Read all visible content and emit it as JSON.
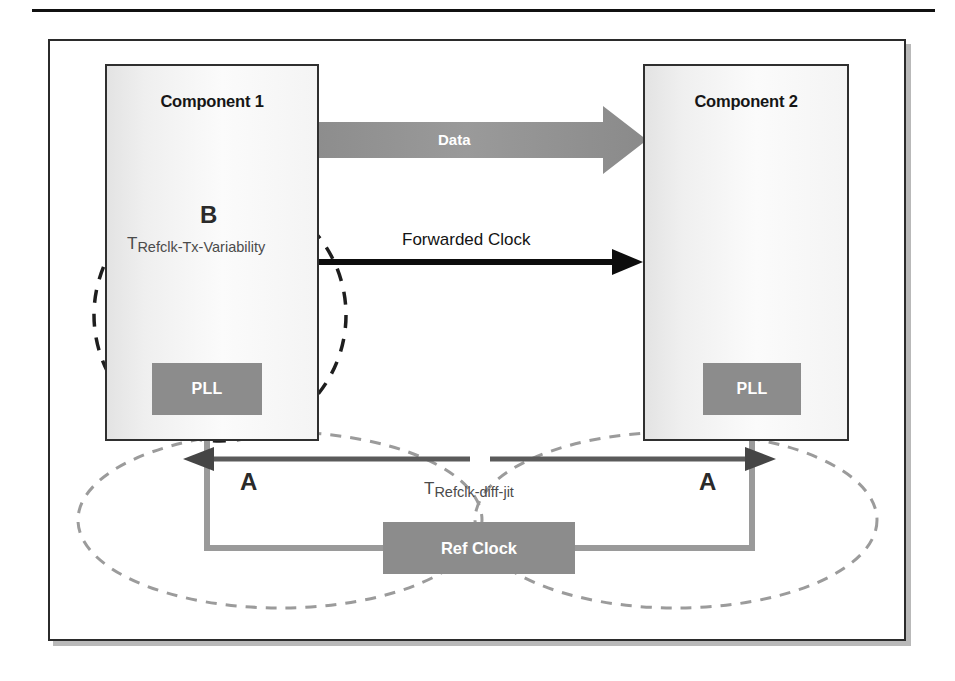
{
  "figure": {
    "components": [
      {
        "id": "component-1",
        "title": "Component 1",
        "pll_label": "PLL"
      },
      {
        "id": "component-2",
        "title": "Component 2",
        "pll_label": "PLL"
      }
    ],
    "ref_clock": {
      "label": "Ref Clock"
    },
    "signals": {
      "data_arrow_label": "Data",
      "forwarded_clock_label": "Forwarded Clock"
    },
    "annotations": {
      "region_b": "B",
      "region_a_left": "A",
      "region_a_right": "A",
      "t_refclk_tx_variability": {
        "base": "T",
        "subscript": "Refclk-Tx-Variability"
      },
      "t_refclk_diff_jit": {
        "base": "T",
        "subscript": "Refclk-diff-jit"
      }
    },
    "colors": {
      "block_fill": "#8c8c8c",
      "data_arrow": "#8a8a8a",
      "dark_arrow": "#4a4a4a",
      "clock_line": "#9a9a9a",
      "frame_border": "#2b2b2b",
      "dashed_dark": "#1e1e1e",
      "dashed_light": "#9b9b9b",
      "text_dark": "#161616",
      "text_gray": "#4b4b4b",
      "text_white": "#ffffff"
    }
  }
}
